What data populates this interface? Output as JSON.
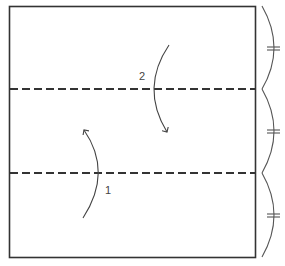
{
  "diagram": {
    "type": "origami-fold-instruction",
    "colors": {
      "stroke": "#333333",
      "arrow": "#444444",
      "brace": "#555555",
      "background": "#ffffff"
    },
    "square": {
      "x": 9,
      "y": 6,
      "width": 246,
      "height": 251
    },
    "fold_lines": [
      {
        "name": "valley-fold-upper",
        "y": 89,
        "style": "dashed"
      },
      {
        "name": "valley-fold-lower",
        "y": 173,
        "style": "dashed"
      }
    ],
    "steps": [
      {
        "number": "1",
        "label": "1",
        "direction": "up",
        "description": "Fold bottom third up along lower dashed line"
      },
      {
        "number": "2",
        "label": "2",
        "direction": "down",
        "description": "Fold top third down along upper dashed line"
      }
    ],
    "divisions": {
      "count": 3,
      "marker": "=",
      "meaning": "equal thirds"
    }
  }
}
